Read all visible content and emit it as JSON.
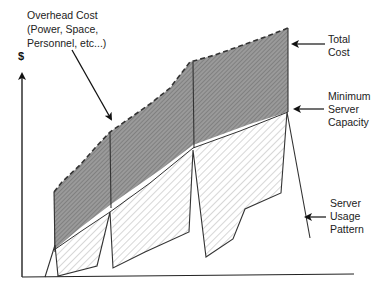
{
  "diagram": {
    "type": "cost-vs-capacity",
    "y_axis_label": "$",
    "annotations": {
      "overhead": {
        "line1": "Overhead Cost",
        "line2": "(Power, Space,",
        "line3": "Personnel, etc...)"
      },
      "total_cost": {
        "line1": "Total",
        "line2": "Cost"
      },
      "min_capacity": {
        "line1": "Minimum",
        "line2": "Server",
        "line3": "Capacity"
      },
      "usage": {
        "line1": "Server",
        "line2": "Usage",
        "line3": "Pattern"
      }
    },
    "regions": [
      {
        "name": "overhead-cost",
        "fill": "#8c8c8c",
        "pattern": "dense-hatch"
      },
      {
        "name": "server-capacity",
        "fill": "#ffffff",
        "pattern": "light-hatch"
      }
    ],
    "colors": {
      "line": "#333333",
      "overhead_fill": "#8f8f8f",
      "hatch_light": "#9a9a9a",
      "background": "#ffffff"
    }
  }
}
